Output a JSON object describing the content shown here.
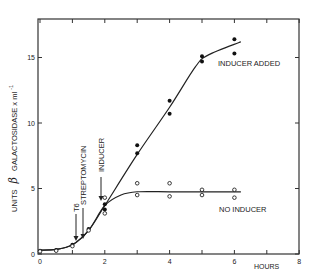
{
  "chart_data": {
    "type": "scatter",
    "title": "",
    "xlabel": "HOURS",
    "ylabel": "UNITS β GALACTOSIDASE x ml⁻¹",
    "xlim": [
      0,
      8
    ],
    "ylim": [
      0,
      18
    ],
    "x_ticks": [
      0,
      2,
      4,
      6,
      8
    ],
    "x_minor_ticks": [
      1,
      3,
      5,
      7
    ],
    "y_ticks": [
      0,
      5,
      10,
      15
    ],
    "grid": false,
    "series": [
      {
        "name": "INDUCER ADDED",
        "marker": "filled-circle",
        "points": [
          [
            0,
            0.25
          ],
          [
            0.5,
            0.3
          ],
          [
            1,
            0.7
          ],
          [
            1.5,
            1.9
          ],
          [
            2,
            3.8
          ],
          [
            2,
            3.4
          ],
          [
            3,
            8.3
          ],
          [
            3,
            7.7
          ],
          [
            4,
            11.7
          ],
          [
            4,
            10.7
          ],
          [
            5,
            15.1
          ],
          [
            5,
            14.7
          ],
          [
            6,
            16.4
          ],
          [
            6,
            15.3
          ]
        ],
        "curve": [
          [
            0,
            0.3
          ],
          [
            0.5,
            0.35
          ],
          [
            1,
            0.7
          ],
          [
            1.5,
            1.8
          ],
          [
            2,
            3.7
          ],
          [
            3,
            7.6
          ],
          [
            4,
            11.2
          ],
          [
            4.8,
            14.3
          ],
          [
            5.2,
            15.2
          ],
          [
            6.2,
            16.2
          ]
        ]
      },
      {
        "name": "NO INDUCER",
        "marker": "open-circle",
        "points": [
          [
            0,
            0.2
          ],
          [
            0.5,
            0.25
          ],
          [
            1,
            0.6
          ],
          [
            1.5,
            1.8
          ],
          [
            2,
            4.3
          ],
          [
            2,
            3.1
          ],
          [
            3,
            5.4
          ],
          [
            3,
            4.5
          ],
          [
            4,
            5.4
          ],
          [
            4,
            4.4
          ],
          [
            5,
            4.9
          ],
          [
            5,
            4.5
          ],
          [
            6,
            4.9
          ],
          [
            6,
            4.3
          ]
        ],
        "curve": [
          [
            0,
            0.3
          ],
          [
            0.5,
            0.35
          ],
          [
            1,
            0.7
          ],
          [
            1.5,
            1.8
          ],
          [
            2,
            3.7
          ],
          [
            2.5,
            4.5
          ],
          [
            3,
            4.75
          ],
          [
            4,
            4.75
          ],
          [
            5,
            4.75
          ],
          [
            6.2,
            4.75
          ]
        ]
      }
    ],
    "annotations": [
      {
        "text": "T6",
        "x": 1.1,
        "arrow_to_y": 1.2,
        "rotated": true
      },
      {
        "text": "STREPTOMYCIN",
        "x": 1.35,
        "arrow_to_y": 1.3,
        "rotated": true
      },
      {
        "text": "INDUCER",
        "x": 1.9,
        "arrow_to_y": 4.1,
        "rotated": true
      },
      {
        "text": "INDUCER ADDED",
        "x": 5.4,
        "y": 14.8
      },
      {
        "text": "NO INDUCER",
        "x": 5.5,
        "y": 3.4
      }
    ]
  },
  "labels": {
    "ylabel_units": "UNITS",
    "ylabel_beta": "β",
    "ylabel_rest": "GALACTOSIDASE x ml",
    "ylabel_exp": "-1",
    "xlabel": "HOURS",
    "t6": "T6",
    "streptomycin": "STREPTOMYCIN",
    "inducer": "INDUCER",
    "inducer_added": "INDUCER ADDED",
    "no_inducer": "NO INDUCER"
  }
}
